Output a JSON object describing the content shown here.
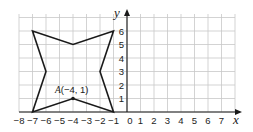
{
  "diagram": {
    "type": "coordinate-grid",
    "x_axis": {
      "name": "x",
      "min": -8,
      "max": 8,
      "tick_labels": [
        "−8",
        "−7",
        "−6",
        "−5",
        "−4",
        "−3",
        "−2",
        "−1",
        "0",
        "1",
        "2",
        "3",
        "4",
        "5",
        "6",
        "7"
      ]
    },
    "y_axis": {
      "name": "y",
      "min": 0,
      "max": 7,
      "tick_labels": [
        "1",
        "2",
        "3",
        "4",
        "5",
        "6"
      ]
    },
    "shape": {
      "name": "four-pointed star",
      "vertices": [
        [
          -7,
          6
        ],
        [
          -4,
          5
        ],
        [
          -1,
          6
        ],
        [
          -2,
          3
        ],
        [
          -1,
          0
        ],
        [
          -4,
          1
        ],
        [
          -7,
          0
        ],
        [
          -6,
          3
        ]
      ]
    },
    "point": {
      "label_letter": "A",
      "label_coords": "(−4, 1)",
      "x": -4,
      "y": 1
    },
    "colors": {
      "grid": "#c8c8c8",
      "axis": "#1a1a1a",
      "shape": "#1a1a1a"
    }
  }
}
